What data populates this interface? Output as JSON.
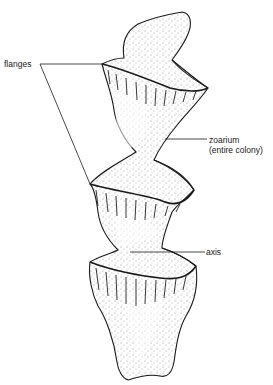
{
  "diagram": {
    "labels": {
      "flanges": "flanges",
      "zoarium": "zoarium",
      "zoarium_note": "(entire colony)",
      "axis": "axis"
    },
    "colors": {
      "ink": "#1a1a1a",
      "background": "#ffffff"
    }
  }
}
